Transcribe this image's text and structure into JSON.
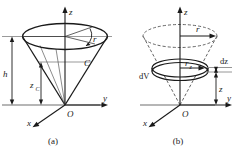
{
  "figure": {
    "title_caption_a": "(a)",
    "title_caption_b": "(b)",
    "panels": [
      {
        "id": "panel-a",
        "caption": "(a)",
        "description": "Cone with apex at origin O, opening upward, showing centroid C, height h, centroid height z_C, top radius r",
        "axes": {
          "z": "z",
          "y": "y",
          "x": "x",
          "origin": "O"
        },
        "labels": {
          "radius": "r",
          "centroid": "C",
          "height": "h",
          "centroid_height_base": "z",
          "centroid_height_sub": "C"
        }
      },
      {
        "id": "panel-b",
        "caption": "(b)",
        "description": "Same cone drawn dashed, with an elemental disk dV of radius r_z and thickness dz at height z",
        "axes": {
          "z": "z",
          "y": "y",
          "x": "x",
          "origin": "O"
        },
        "labels": {
          "radius": "r",
          "element_volume": "dV",
          "disk_radius_base": "r",
          "disk_radius_sub": "z",
          "thickness": "dz",
          "height_z": "z"
        }
      }
    ]
  },
  "colors": {
    "stroke_dark": "#1a1a1a",
    "stroke_gray": "#8a8a8a",
    "stroke_mid": "#555555",
    "background": "#ffffff"
  }
}
